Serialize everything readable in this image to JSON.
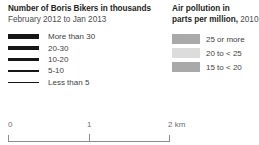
{
  "bikes_legend": {
    "title": "Number of Boris Bikers in thousands",
    "subtitle": "February 2012 to Jan 2013",
    "items": [
      {
        "label": "More than 30",
        "width_px": 5
      },
      {
        "label": "20-30",
        "width_px": 4
      },
      {
        "label": "10-20",
        "width_px": 2.6
      },
      {
        "label": "5-10",
        "width_px": 1.6
      },
      {
        "label": "Less than 5",
        "width_px": 1
      }
    ],
    "line_color": "#151515"
  },
  "pollution_legend": {
    "title_line1": "Air pollution in",
    "title_line2": "parts per million,",
    "title_year": "2010",
    "items": [
      {
        "label": "25 or more",
        "color": "#a9a9a9"
      },
      {
        "label": "20 to < 25",
        "color": "#dcdcdc"
      },
      {
        "label": "15 to < 20",
        "color": "#a9a9a9"
      }
    ]
  },
  "scale_bar": {
    "start_label": "0",
    "mid_label": "1",
    "end_label": "2 km",
    "unit": "km",
    "rule_color": "#8c8c8c"
  }
}
